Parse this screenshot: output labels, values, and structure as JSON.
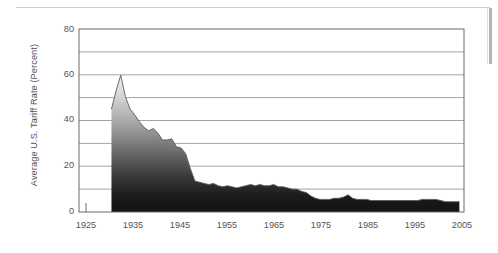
{
  "chart_data": {
    "type": "area",
    "title": "",
    "xlabel": "",
    "ylabel": "Average U.S. Tariff Rate (Percent)",
    "xlim": [
      1923,
      2006
    ],
    "ylim": [
      0,
      80
    ],
    "ytick_labels": [
      "0",
      "20",
      "40",
      "60",
      "80"
    ],
    "ytick_values": [
      0,
      20,
      40,
      60,
      80
    ],
    "gridline_values": [
      10,
      20,
      30,
      40,
      50,
      60,
      70,
      80
    ],
    "grid": true,
    "legend": "none",
    "fill_style": "vertical gradient light-gray (top) to near-black (bottom)",
    "line_color": "#555555",
    "series": [
      {
        "name": "Average U.S. Tariff Rate",
        "x": [
          1930,
          1931,
          1932,
          1933,
          1934,
          1935,
          1936,
          1937,
          1938,
          1939,
          1940,
          1941,
          1942,
          1943,
          1944,
          1945,
          1946,
          1947,
          1948,
          1949,
          1950,
          1951,
          1952,
          1953,
          1954,
          1955,
          1956,
          1957,
          1958,
          1959,
          1960,
          1961,
          1962,
          1963,
          1964,
          1965,
          1966,
          1967,
          1968,
          1969,
          1970,
          1971,
          1972,
          1973,
          1974,
          1975,
          1976,
          1977,
          1978,
          1979,
          1980,
          1981,
          1982,
          1983,
          1984,
          1985,
          1986,
          1987,
          1988,
          1989,
          1990,
          1991,
          1992,
          1993,
          1994,
          1995,
          1996,
          1997,
          1998,
          1999,
          2000,
          2001,
          2002,
          2003,
          2004,
          2005
        ],
        "y": [
          45.0,
          53.0,
          59.8,
          50.5,
          45.0,
          42.5,
          39.5,
          37.0,
          35.5,
          36.5,
          34.5,
          31.5,
          31.5,
          32.0,
          28.5,
          28.0,
          25.5,
          19.0,
          13.5,
          13.0,
          12.5,
          12.0,
          12.5,
          11.5,
          11.0,
          11.5,
          11.0,
          10.5,
          11.0,
          11.5,
          12.0,
          11.5,
          12.0,
          11.5,
          11.5,
          12.0,
          11.0,
          11.0,
          10.5,
          10.0,
          10.0,
          9.0,
          8.5,
          7.0,
          6.0,
          5.5,
          5.5,
          5.5,
          6.0,
          6.0,
          6.5,
          7.5,
          6.0,
          5.5,
          5.5,
          5.5,
          5.0,
          5.0,
          5.0,
          5.0,
          5.0,
          5.0,
          5.0,
          5.0,
          5.0,
          5.0,
          5.0,
          5.5,
          5.5,
          5.5,
          5.5,
          5.0,
          4.5,
          4.5,
          4.5,
          4.5
        ]
      }
    ],
    "xtick_labels": [
      "1925",
      "1935",
      "1945",
      "1955",
      "1965",
      "1975",
      "1985",
      "1995",
      "2005"
    ],
    "xtick_values": [
      1925,
      1935,
      1945,
      1955,
      1965,
      1975,
      1985,
      1995,
      2005
    ]
  }
}
